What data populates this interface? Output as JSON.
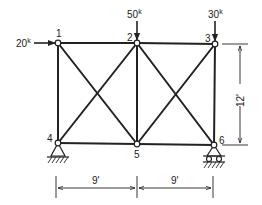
{
  "diagram": {
    "type": "truss",
    "nodes": [
      {
        "id": "1",
        "label": "1",
        "x": 58,
        "y": 43
      },
      {
        "id": "2",
        "label": "2",
        "x": 137,
        "y": 43
      },
      {
        "id": "3",
        "label": "3",
        "x": 215,
        "y": 44
      },
      {
        "id": "4",
        "label": "4",
        "x": 58,
        "y": 143
      },
      {
        "id": "5",
        "label": "5",
        "x": 137,
        "y": 144
      },
      {
        "id": "6",
        "label": "6",
        "x": 214,
        "y": 145
      }
    ],
    "members": [
      [
        "1",
        "2"
      ],
      [
        "2",
        "3"
      ],
      [
        "4",
        "5"
      ],
      [
        "5",
        "6"
      ],
      [
        "1",
        "4"
      ],
      [
        "2",
        "5"
      ],
      [
        "3",
        "6"
      ],
      [
        "1",
        "5"
      ],
      [
        "2",
        "4"
      ],
      [
        "2",
        "6"
      ],
      [
        "3",
        "5"
      ]
    ],
    "loads": [
      {
        "node": "1",
        "label": "20",
        "unit": "k",
        "direction": "right"
      },
      {
        "node": "2",
        "label": "50",
        "unit": "k",
        "direction": "down"
      },
      {
        "node": "3",
        "label": "30",
        "unit": "k",
        "direction": "down"
      }
    ],
    "supports": [
      {
        "node": "4",
        "type": "pin"
      },
      {
        "node": "6",
        "type": "roller"
      }
    ],
    "dimensions": {
      "height": "12'",
      "span_left": "9'",
      "span_right": "9'"
    }
  }
}
